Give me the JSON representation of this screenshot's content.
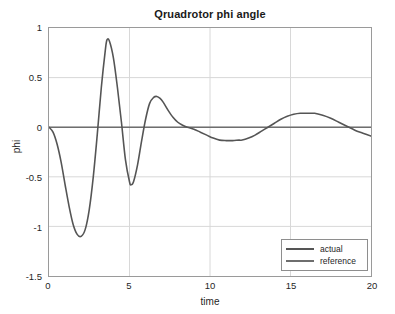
{
  "chart_data": {
    "type": "line",
    "title": "Qruadrotor phi angle",
    "xlabel": "time",
    "ylabel": "phi",
    "xlim": [
      0,
      20
    ],
    "ylim": [
      -1.5,
      1
    ],
    "xticks": [
      "0",
      "5",
      "10",
      "15",
      "20"
    ],
    "xtick_values": [
      0,
      5,
      10,
      15,
      20
    ],
    "yticks": [
      "1",
      "0.5",
      "0",
      "-0.5",
      "-1",
      "-1.5"
    ],
    "ytick_values": [
      1,
      0.5,
      0,
      -0.5,
      -1,
      -1.5
    ],
    "grid": true,
    "legend_position": "lower right",
    "series": [
      {
        "name": "actual",
        "color": "#555555",
        "linewidth": 1.6,
        "x": [
          0.0,
          0.25,
          0.5,
          0.75,
          1.0,
          1.25,
          1.5,
          1.75,
          2.0,
          2.25,
          2.5,
          2.75,
          3.0,
          3.25,
          3.5,
          3.6,
          3.75,
          4.0,
          4.25,
          4.5,
          4.75,
          5.0,
          5.1,
          5.25,
          5.5,
          5.75,
          6.0,
          6.25,
          6.5,
          6.7,
          6.9,
          7.1,
          7.4,
          7.7,
          8.0,
          8.3,
          8.6,
          9.0,
          9.4,
          9.8,
          10.2,
          10.6,
          11.0,
          11.4,
          11.8,
          12.0,
          12.4,
          12.8,
          13.2,
          13.6,
          14.0,
          14.4,
          14.8,
          15.2,
          15.6,
          16.0,
          16.5,
          17.0,
          17.5,
          18.0,
          18.5,
          19.0,
          19.5,
          20.0
        ],
        "y": [
          0.0,
          -0.05,
          -0.17,
          -0.35,
          -0.58,
          -0.8,
          -0.98,
          -1.08,
          -1.1,
          -1.03,
          -0.83,
          -0.5,
          -0.07,
          0.4,
          0.78,
          0.88,
          0.87,
          0.7,
          0.4,
          0.05,
          -0.33,
          -0.55,
          -0.58,
          -0.55,
          -0.38,
          -0.14,
          0.08,
          0.24,
          0.3,
          0.31,
          0.29,
          0.25,
          0.17,
          0.1,
          0.05,
          0.02,
          0.0,
          -0.02,
          -0.05,
          -0.08,
          -0.11,
          -0.13,
          -0.135,
          -0.135,
          -0.13,
          -0.13,
          -0.11,
          -0.08,
          -0.04,
          0.0,
          0.04,
          0.08,
          0.11,
          0.13,
          0.14,
          0.14,
          0.14,
          0.12,
          0.09,
          0.05,
          0.01,
          -0.03,
          -0.06,
          -0.09
        ]
      },
      {
        "name": "reference",
        "color": "#6e6e6e",
        "linewidth": 1.4,
        "x": [
          0,
          20
        ],
        "y": [
          0,
          0
        ]
      }
    ],
    "annotations": {
      "extrema": [
        {
          "t": 1.95,
          "value": -1.1,
          "kind": "minimum"
        },
        {
          "t": 3.6,
          "value": 0.88,
          "kind": "maximum"
        },
        {
          "t": 5.1,
          "value": -0.58,
          "kind": "minimum"
        },
        {
          "t": 6.7,
          "value": 0.31,
          "kind": "maximum"
        },
        {
          "t": 12.0,
          "value": -0.135,
          "kind": "minimum"
        },
        {
          "t": 16.4,
          "value": 0.14,
          "kind": "maximum"
        }
      ]
    },
    "style": {
      "background": "#ffffff",
      "grid_color": "#d8d8d8",
      "axes_color": "#9a9a9a",
      "text_color": "#1f1f1f"
    }
  },
  "legend": {
    "items": [
      {
        "label": "actual"
      },
      {
        "label": "reference"
      }
    ]
  }
}
